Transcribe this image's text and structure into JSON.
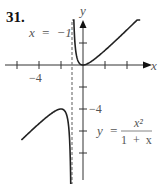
{
  "problem_number": "31.",
  "asymptote_label": "x  =  −1",
  "axis_labels": {
    "x": "x",
    "y": "y"
  },
  "tick_labels": {
    "x_neg4": "−4",
    "y_neg4": "−4"
  },
  "equation": {
    "lhs": "y  =",
    "numerator": "x²",
    "denominator": "1  +  x"
  },
  "colors": {
    "curve": "#222222",
    "axes": "#333333",
    "asymptote": "#777777",
    "text": "#555555"
  },
  "chart_data": {
    "type": "line",
    "title": "",
    "function": "y = x^2 / (1 + x)",
    "xlabel": "x",
    "ylabel": "y",
    "xlim": [
      -6.5,
      6.5
    ],
    "ylim": [
      -10,
      5.5
    ],
    "x_ticks": [
      -6,
      -4,
      -2,
      2,
      4
    ],
    "y_ticks": [
      2,
      -2,
      -4,
      -6,
      -8
    ],
    "labeled_ticks": {
      "x": [
        -4
      ],
      "y": [
        -4
      ]
    },
    "vertical_asymptote": -1,
    "local_extrema": [
      {
        "type": "local_min",
        "x": 0,
        "y": 0
      },
      {
        "type": "local_max",
        "x": -2,
        "y": -4
      }
    ],
    "branches": [
      {
        "name": "right",
        "x_range": [
          -0.95,
          5.2
        ]
      },
      {
        "name": "left",
        "x_range": [
          -5.6,
          -1.02
        ]
      }
    ],
    "grid": false,
    "legend": null
  }
}
